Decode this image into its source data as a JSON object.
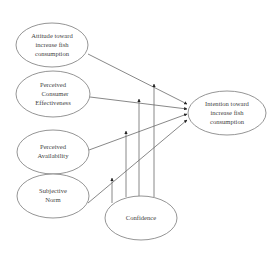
{
  "diagram": {
    "type": "path-model",
    "nodes": [
      {
        "id": "attitude",
        "lines": [
          "Attitude toward",
          "increase fish",
          "consumption"
        ]
      },
      {
        "id": "pce",
        "lines": [
          "Perceived",
          "Consumer",
          "Effectiveness"
        ]
      },
      {
        "id": "availability",
        "lines": [
          "Perceived",
          "Availability"
        ]
      },
      {
        "id": "norm",
        "lines": [
          "Subjective",
          "Norm"
        ]
      },
      {
        "id": "confidence",
        "lines": [
          "Confidence"
        ]
      },
      {
        "id": "intention",
        "lines": [
          "Intention toward",
          "increase fish",
          "consumption"
        ]
      }
    ],
    "edges": [
      {
        "from": "attitude",
        "to": "intention",
        "kind": "direct"
      },
      {
        "from": "pce",
        "to": "intention",
        "kind": "direct"
      },
      {
        "from": "availability",
        "to": "intention",
        "kind": "direct"
      },
      {
        "from": "norm",
        "to": "intention",
        "kind": "direct"
      },
      {
        "from": "confidence",
        "to": "attitude->intention",
        "kind": "moderation"
      },
      {
        "from": "confidence",
        "to": "pce->intention",
        "kind": "moderation"
      },
      {
        "from": "confidence",
        "to": "availability->intention",
        "kind": "moderation"
      },
      {
        "from": "confidence",
        "to": "norm->intention",
        "kind": "moderation"
      }
    ]
  }
}
